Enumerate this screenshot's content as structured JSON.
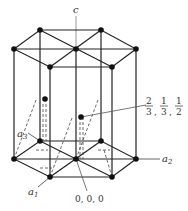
{
  "diagram": {
    "axes": {
      "c": "c",
      "a1": "a",
      "a1_sub": "1",
      "a2": "a",
      "a2_sub": "2",
      "a3": "a",
      "a3_sub": "3"
    },
    "origin_label": "0, 0, 0",
    "interior_atom_label": {
      "num1": "2",
      "den1": "3",
      "num2": "1",
      "den2": "3",
      "num3": "1",
      "den3": "2",
      "sep": ","
    },
    "colors": {
      "line": "#222222",
      "atom": "#111111",
      "label": "#333333",
      "axis": "#888888"
    }
  }
}
